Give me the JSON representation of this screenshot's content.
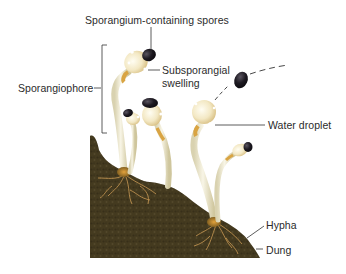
{
  "figure": {
    "labels": {
      "sporangium": "Sporangium-containing spores",
      "sporangiophore": "Sporangiophore",
      "subsporangial_line1": "Subsporangial",
      "subsporangial_line2": "swelling",
      "water_droplet": "Water droplet",
      "hypha": "Hypha",
      "dung": "Dung"
    },
    "colors": {
      "background": "#ffffff",
      "dung": "#4a3f22",
      "dung_dark": "#2f2814",
      "stalk": "#f1ecd6",
      "swelling": "#f3e8c4",
      "swelling_base": "#d9a443",
      "sporangium": "#1e1a22",
      "hyphae": "#c99a55",
      "label_text": "#2b2b2b",
      "leader_line": "#333333"
    }
  }
}
